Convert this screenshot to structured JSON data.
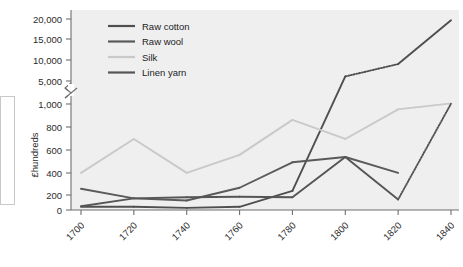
{
  "chart_data": {
    "type": "line",
    "title": "",
    "xlabel": "",
    "ylabel": "£hundreds",
    "categories": [
      1700,
      1720,
      1740,
      1760,
      1780,
      1800,
      1820,
      1840
    ],
    "x_tick_labels": [
      "1700",
      "1720",
      "1740",
      "1760",
      "1780",
      "1800",
      "1820",
      "1840"
    ],
    "y_tick_labels": [
      "0",
      "200",
      "400",
      "600",
      "800",
      "1,000",
      "5,000",
      "10,000",
      "15,000",
      "20,000"
    ],
    "y_tick_values": [
      0,
      200,
      400,
      600,
      800,
      1000,
      5000,
      10000,
      15000,
      20000
    ],
    "axis_break": true,
    "axis_break_between": [
      1000,
      5000
    ],
    "grid": false,
    "legend_position": "top-left",
    "series": [
      {
        "name": "Raw cotton",
        "color": "#4f4f4f",
        "values": [
          30,
          30,
          20,
          30,
          180,
          6100,
          9100,
          19700
        ],
        "dotted_segments": [
          [
            5,
            6
          ]
        ]
      },
      {
        "name": "Raw wool",
        "color": "#5a5a5a",
        "values": [
          200,
          110,
          90,
          210,
          450,
          500,
          350,
          null
        ],
        "dotted_segments": []
      },
      {
        "name": "Silk",
        "color": "#c9c9c9",
        "values": [
          350,
          670,
          350,
          520,
          850,
          670,
          950,
          1100
        ],
        "dotted_segments": [
          [
            6,
            7
          ]
        ]
      },
      {
        "name": "Linen yarn",
        "color": "#555555",
        "values": [
          35,
          110,
          120,
          125,
          120,
          500,
          100,
          1050
        ],
        "dotted_segments": [
          [
            6,
            7
          ]
        ]
      }
    ]
  },
  "legend": {
    "items": [
      {
        "label": "Raw cotton",
        "color": "#4f4f4f"
      },
      {
        "label": "Raw wool",
        "color": "#5a5a5a"
      },
      {
        "label": "Silk",
        "color": "#c9c9c9"
      },
      {
        "label": "Linen yarn",
        "color": "#555555"
      }
    ]
  },
  "colors": {
    "plot_background": "#efeff0",
    "axis": "#6f6f6f",
    "text": "#2b2b2b"
  }
}
